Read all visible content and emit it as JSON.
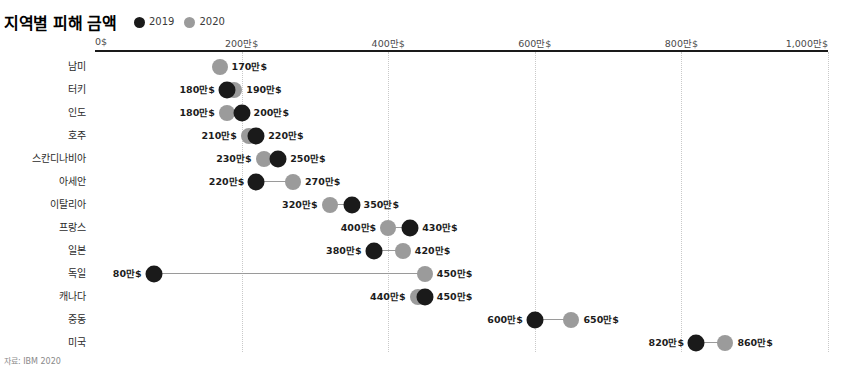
{
  "title": "지역별 피해 금액",
  "source_note": "자료: IBM 2020",
  "legend": {
    "position": "top-left",
    "items": [
      {
        "label": "2019",
        "color": "#1a1a1a",
        "icon": "filled-circle-icon"
      },
      {
        "label": "2020",
        "color": "#9b9b9b",
        "icon": "filled-circle-icon"
      }
    ]
  },
  "axis": {
    "ticks": [
      {
        "label": "0$",
        "value": 0
      },
      {
        "label": "200만$",
        "value": 200
      },
      {
        "label": "400만$",
        "value": 400
      },
      {
        "label": "600만$",
        "value": 600
      },
      {
        "label": "800만$",
        "value": 800
      },
      {
        "label": "1,000만$",
        "value": 1000
      }
    ]
  },
  "chart_data": {
    "type": "scatter",
    "subtype": "dumbbell",
    "title": "지역별 피해 금액",
    "xlabel": "",
    "ylabel": "",
    "xlim": [
      0,
      1000
    ],
    "xunit": "만$",
    "grid": true,
    "legend_position": "top-left",
    "categories": [
      "남미",
      "터키",
      "인도",
      "호주",
      "스칸디나비아",
      "아세안",
      "이탈리아",
      "프랑스",
      "일본",
      "독일",
      "캐나다",
      "중동",
      "미국"
    ],
    "series": [
      {
        "name": "2019",
        "color": "#1a1a1a",
        "values": [
          null,
          180,
          180,
          210,
          230,
          220,
          320,
          400,
          380,
          80,
          440,
          600,
          820
        ]
      },
      {
        "name": "2020",
        "color": "#9b9b9b",
        "values": [
          170,
          190,
          200,
          220,
          250,
          270,
          350,
          430,
          420,
          450,
          450,
          650,
          860
        ]
      }
    ],
    "rows": [
      {
        "category": "남미",
        "v2019": null,
        "v2020": 170,
        "label2019": "",
        "label2020": "170만$"
      },
      {
        "category": "터키",
        "v2019": 180,
        "v2020": 190,
        "label2019": "180만$",
        "label2020": "190만$"
      },
      {
        "category": "인도",
        "v2019": 200,
        "v2020": 180,
        "label2019": "200만$",
        "label2020": "180만$"
      },
      {
        "category": "호주",
        "v2019": 220,
        "v2020": 210,
        "label2019": "220만$",
        "label2020": "210만$"
      },
      {
        "category": "스칸디나비아",
        "v2019": 250,
        "v2020": 230,
        "label2019": "250만$",
        "label2020": "230만$"
      },
      {
        "category": "아세안",
        "v2019": 220,
        "v2020": 270,
        "label2019": "220만$",
        "label2020": "270만$"
      },
      {
        "category": "이탈리아",
        "v2019": 350,
        "v2020": 320,
        "label2019": "350만$",
        "label2020": "320만$"
      },
      {
        "category": "프랑스",
        "v2019": 430,
        "v2020": 400,
        "label2019": "430만$",
        "label2020": "400만$"
      },
      {
        "category": "일본",
        "v2019": 380,
        "v2020": 420,
        "label2019": "380만$",
        "label2020": "420만$"
      },
      {
        "category": "독일",
        "v2019": 80,
        "v2020": 450,
        "label2019": "80만$",
        "label2020": "450만$"
      },
      {
        "category": "캐나다",
        "v2019": 450,
        "v2020": 440,
        "label2019": "450만$",
        "label2020": "440만$"
      },
      {
        "category": "중동",
        "v2019": 600,
        "v2020": 650,
        "label2019": "600만$",
        "label2020": "650만$"
      },
      {
        "category": "미국",
        "v2019": 820,
        "v2020": 860,
        "label2019": "820만$",
        "label2020": "860만$"
      }
    ]
  }
}
